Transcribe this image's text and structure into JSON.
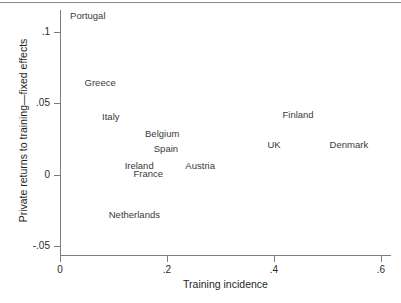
{
  "chart_data": {
    "type": "scatter",
    "title": "",
    "subtitle": "",
    "xlabel": "Training incidence",
    "ylabel": "Private returns to training—fixed effects",
    "xlim": [
      -0.02,
      0.62
    ],
    "ylim": [
      -0.062,
      0.118
    ],
    "xticks": [
      "0",
      ".2",
      ".4",
      ".6"
    ],
    "xtick_values": [
      0,
      0.2,
      0.4,
      0.6
    ],
    "yticks": [
      ".1",
      ".05",
      "0",
      "-.05"
    ],
    "ytick_values": [
      0.1,
      0.05,
      0,
      -0.05
    ],
    "grid": false,
    "legend": "none",
    "marker_style": "text-label",
    "points": [
      {
        "label": "Portugal",
        "x": 0.052,
        "y": 0.1115
      },
      {
        "label": "Greece",
        "x": 0.075,
        "y": 0.064
      },
      {
        "label": "Italy",
        "x": 0.095,
        "y": 0.0402
      },
      {
        "label": "Belgium",
        "x": 0.191,
        "y": 0.0283
      },
      {
        "label": "Spain",
        "x": 0.198,
        "y": 0.0178
      },
      {
        "label": "Ireland",
        "x": 0.148,
        "y": 0.0059
      },
      {
        "label": "France",
        "x": 0.165,
        "y": 0.0002
      },
      {
        "label": "Austria",
        "x": 0.262,
        "y": 0.0059
      },
      {
        "label": "Netherlands",
        "x": 0.139,
        "y": -0.0285
      },
      {
        "label": "Finland",
        "x": 0.445,
        "y": 0.0416
      },
      {
        "label": "UK",
        "x": 0.4,
        "y": 0.0206
      },
      {
        "label": "Denmark",
        "x": 0.54,
        "y": 0.0206
      }
    ]
  },
  "axes": {
    "x_title": "Training incidence",
    "y_title": "Private returns to training—fixed effects",
    "x_tick_labels": [
      "0",
      ".2",
      ".4",
      ".6"
    ],
    "y_tick_labels": [
      ".1",
      ".05",
      "0",
      "-.05"
    ]
  },
  "colors": {
    "axis": "#7d7d7d",
    "text": "#2b2b2b",
    "point_text": "#3a3a3a",
    "background": "#ffffff",
    "top_rule": "#8a8a8a"
  }
}
